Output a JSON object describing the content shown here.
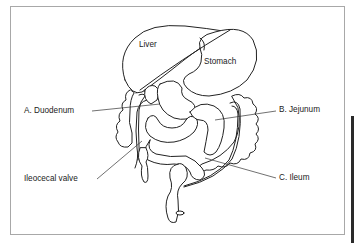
{
  "diagram": {
    "organ_labels": {
      "liver": "Liver",
      "stomach": "Stomach"
    },
    "callouts": [
      {
        "id": "duodenum",
        "label": "A. Duodenum"
      },
      {
        "id": "jejunum",
        "label": "B. Jejunum"
      },
      {
        "id": "ileum",
        "label": "C. Ileum"
      },
      {
        "id": "ileocecal-valve",
        "label": "Ileocecal valve"
      }
    ],
    "colors": {
      "line": "#222222",
      "frame": "#a8a8a8",
      "background": "#ffffff"
    }
  }
}
